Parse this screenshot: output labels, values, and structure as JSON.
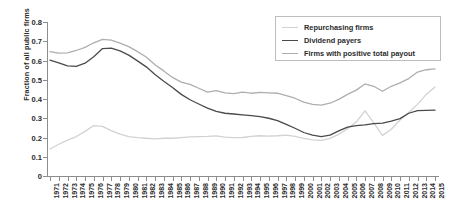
{
  "chart_data": {
    "type": "line",
    "title": "",
    "xlabel": "",
    "ylabel": "Fraction of all public firms",
    "ylim": [
      0,
      0.8
    ],
    "ytick_labels": [
      "0",
      "0.1",
      "0.2",
      "0.3",
      "0.4",
      "0.5",
      "0.6",
      "0.7",
      "0.8"
    ],
    "ytick_values": [
      0,
      0.1,
      0.2,
      0.3,
      0.4,
      0.5,
      0.6,
      0.7,
      0.8
    ],
    "grid": false,
    "legend_position": "top-right",
    "categories": [
      "1971",
      "1972",
      "1973",
      "1974",
      "1975",
      "1976",
      "1977",
      "1978",
      "1979",
      "1980",
      "1981",
      "1982",
      "1983",
      "1984",
      "1985",
      "1986",
      "1987",
      "1988",
      "1989",
      "1990",
      "1991",
      "1992",
      "1993",
      "1994",
      "1995",
      "1996",
      "1997",
      "1998",
      "1999",
      "2000",
      "2001",
      "2002",
      "2003",
      "2004",
      "2005",
      "2006",
      "2007",
      "2008",
      "2009",
      "2010",
      "2011",
      "2012",
      "2013",
      "2014",
      "2015"
    ],
    "series": [
      {
        "name": "Repurchasing firms",
        "color": "#d2d2d2",
        "values": [
          0.14,
          0.165,
          0.186,
          0.205,
          0.232,
          0.262,
          0.258,
          0.236,
          0.218,
          0.205,
          0.199,
          0.196,
          0.193,
          0.196,
          0.196,
          0.199,
          0.203,
          0.205,
          0.206,
          0.208,
          0.202,
          0.199,
          0.2,
          0.206,
          0.209,
          0.207,
          0.209,
          0.212,
          0.206,
          0.196,
          0.188,
          0.185,
          0.195,
          0.216,
          0.246,
          0.28,
          0.338,
          0.276,
          0.211,
          0.243,
          0.291,
          0.33,
          0.372,
          0.424,
          0.462
        ]
      },
      {
        "name": "Dividend payers",
        "color": "#4a4a4a",
        "values": [
          0.602,
          0.588,
          0.572,
          0.57,
          0.586,
          0.62,
          0.662,
          0.664,
          0.65,
          0.628,
          0.598,
          0.567,
          0.527,
          0.492,
          0.46,
          0.424,
          0.396,
          0.374,
          0.353,
          0.336,
          0.326,
          0.322,
          0.318,
          0.314,
          0.308,
          0.3,
          0.288,
          0.268,
          0.248,
          0.226,
          0.212,
          0.204,
          0.212,
          0.234,
          0.254,
          0.262,
          0.266,
          0.272,
          0.275,
          0.285,
          0.298,
          0.326,
          0.34,
          0.341,
          0.342
        ]
      },
      {
        "name": "Firms with positive total payout",
        "color": "#aeaeae",
        "values": [
          0.646,
          0.638,
          0.64,
          0.652,
          0.668,
          0.692,
          0.71,
          0.706,
          0.69,
          0.672,
          0.646,
          0.618,
          0.578,
          0.546,
          0.512,
          0.488,
          0.476,
          0.456,
          0.436,
          0.444,
          0.432,
          0.428,
          0.436,
          0.43,
          0.434,
          0.432,
          0.43,
          0.418,
          0.404,
          0.384,
          0.372,
          0.368,
          0.378,
          0.398,
          0.424,
          0.446,
          0.478,
          0.466,
          0.44,
          0.466,
          0.484,
          0.506,
          0.54,
          0.552,
          0.556
        ]
      }
    ]
  },
  "legend": {
    "items": [
      {
        "label": "Repurchasing firms",
        "color": "#d2d2d2"
      },
      {
        "label": "Dividend payers",
        "color": "#4a4a4a"
      },
      {
        "label": "Firms with positive total payout",
        "color": "#aeaeae"
      }
    ]
  }
}
